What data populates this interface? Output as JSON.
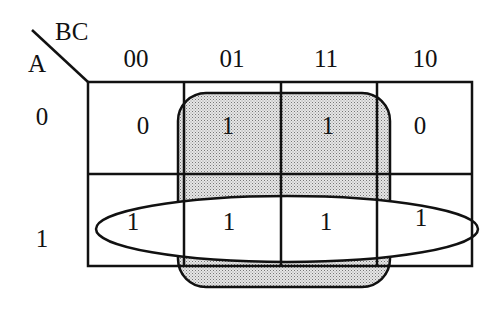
{
  "diagram": {
    "type": "karnaugh-map",
    "row_variable": "A",
    "column_variables": "BC",
    "column_headers": [
      "00",
      "01",
      "11",
      "10"
    ],
    "row_headers": [
      "0",
      "1"
    ],
    "cells": [
      [
        "0",
        "1",
        "1",
        "0"
      ],
      [
        "1",
        "1",
        "1",
        "1"
      ]
    ],
    "groups": [
      {
        "name": "shaded-group-BC01-11",
        "shape": "rounded-rectangle",
        "fill": "dotted-gray",
        "covers": "columns 01 and 11, both rows"
      },
      {
        "name": "oval-group-row-A1",
        "shape": "ellipse",
        "fill": "none",
        "covers": "row A=1, all columns"
      }
    ],
    "colors": {
      "line": "#111111",
      "shade": "#d9d9d9",
      "background": "#ffffff"
    }
  }
}
